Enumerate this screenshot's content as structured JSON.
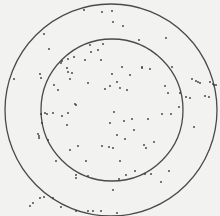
{
  "figure": {
    "background": "#f2f2f0",
    "stroke_color": "#4a4a4a",
    "dot_color": "#3a3a3a",
    "outer_circle": {
      "cx": 111,
      "cy": 110,
      "r": 106
    },
    "inner_circle": {
      "cx": 112,
      "cy": 110,
      "r": 71
    },
    "dots": [
      [
        84,
        10
      ],
      [
        102,
        12
      ],
      [
        112,
        11
      ],
      [
        113,
        22
      ],
      [
        123,
        26
      ],
      [
        44,
        34
      ],
      [
        139,
        40
      ],
      [
        166,
        38
      ],
      [
        49,
        49
      ],
      [
        90,
        45
      ],
      [
        103,
        44
      ],
      [
        98,
        50
      ],
      [
        91,
        52
      ],
      [
        62,
        61
      ],
      [
        68,
        59
      ],
      [
        61,
        63
      ],
      [
        74,
        57
      ],
      [
        85,
        60
      ],
      [
        101,
        60
      ],
      [
        150,
        69
      ],
      [
        14,
        79
      ],
      [
        40,
        74
      ],
      [
        41,
        78
      ],
      [
        67,
        68
      ],
      [
        68,
        72
      ],
      [
        72,
        73
      ],
      [
        54,
        85
      ],
      [
        70,
        79
      ],
      [
        88,
        83
      ],
      [
        122,
        67
      ],
      [
        142,
        67
      ],
      [
        172,
        67
      ],
      [
        58,
        90
      ],
      [
        75,
        104
      ],
      [
        76,
        105
      ],
      [
        105,
        89
      ],
      [
        130,
        75
      ],
      [
        142,
        68
      ],
      [
        112,
        74
      ],
      [
        117,
        82
      ],
      [
        192,
        79
      ],
      [
        196,
        81
      ],
      [
        198,
        82
      ],
      [
        200,
        83
      ],
      [
        210,
        82
      ],
      [
        213,
        84
      ],
      [
        214,
        85
      ],
      [
        216,
        85
      ],
      [
        110,
        86
      ],
      [
        120,
        88
      ],
      [
        127,
        90
      ],
      [
        165,
        86
      ],
      [
        168,
        93
      ],
      [
        180,
        93
      ],
      [
        186,
        97
      ],
      [
        190,
        98
      ],
      [
        205,
        96
      ],
      [
        209,
        97
      ],
      [
        41,
        114
      ],
      [
        45,
        113
      ],
      [
        47,
        114
      ],
      [
        53,
        113
      ],
      [
        62,
        116
      ],
      [
        68,
        113
      ],
      [
        42,
        123
      ],
      [
        67,
        125
      ],
      [
        38,
        134
      ],
      [
        39,
        136
      ],
      [
        39,
        138
      ],
      [
        48,
        140
      ],
      [
        114,
        112
      ],
      [
        124,
        121
      ],
      [
        132,
        119
      ],
      [
        162,
        114
      ],
      [
        171,
        114
      ],
      [
        179,
        107
      ],
      [
        194,
        127
      ],
      [
        110,
        123
      ],
      [
        148,
        119
      ],
      [
        134,
        130
      ],
      [
        117,
        135
      ],
      [
        102,
        146
      ],
      [
        109,
        147
      ],
      [
        113,
        148
      ],
      [
        125,
        139
      ],
      [
        144,
        145
      ],
      [
        146,
        148
      ],
      [
        154,
        142
      ],
      [
        56,
        161
      ],
      [
        78,
        146
      ],
      [
        70,
        150
      ],
      [
        86,
        161
      ],
      [
        120,
        161
      ],
      [
        135,
        171
      ],
      [
        76,
        175
      ],
      [
        76,
        178
      ],
      [
        88,
        176
      ],
      [
        119,
        179
      ],
      [
        126,
        175
      ],
      [
        145,
        174
      ],
      [
        151,
        174
      ],
      [
        161,
        182
      ],
      [
        113,
        190
      ],
      [
        169,
        171
      ],
      [
        76,
        211
      ],
      [
        101,
        211
      ],
      [
        88,
        211
      ],
      [
        93,
        211
      ],
      [
        117,
        213
      ],
      [
        61,
        207
      ],
      [
        33,
        203
      ],
      [
        30,
        206
      ],
      [
        40,
        198
      ],
      [
        44,
        197
      ],
      [
        53,
        198
      ]
    ]
  }
}
